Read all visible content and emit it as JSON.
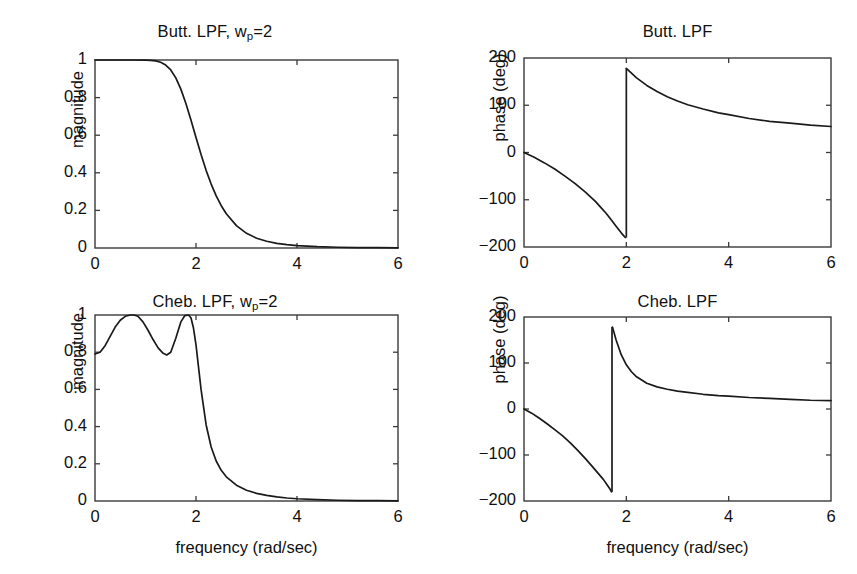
{
  "figure": {
    "background": "#ffffff",
    "line_color": "#1a1a1a",
    "axis_color": "#3a3a3a"
  },
  "panels": {
    "top_left": {
      "title_main": "Butt. LPF, w",
      "title_sub": "p",
      "title_tail": "=2"
    },
    "top_right": {
      "title_main": "Butt. LPF",
      "title_sub": "",
      "title_tail": ""
    },
    "bottom_left": {
      "title_main": "Cheb. LPF, w",
      "title_sub": "p",
      "title_tail": "=2"
    },
    "bottom_right": {
      "title_main": "Cheb. LPF",
      "title_sub": "",
      "title_tail": ""
    }
  },
  "chart_data": [
    {
      "id": "butterworth-magnitude",
      "type": "line",
      "title": "Butt. LPF, w_p=2",
      "xlabel": "",
      "ylabel": "magnitude",
      "xlim": [
        0,
        6
      ],
      "ylim": [
        0,
        1
      ],
      "xticks": [
        0,
        2,
        4,
        6
      ],
      "xticklabels": [
        "0",
        "2",
        "4",
        "6"
      ],
      "yticks": [
        0,
        0.2,
        0.4,
        0.6,
        0.8,
        1
      ],
      "yticklabels": [
        "0",
        "0.2",
        "0.4",
        "0.6",
        "0.8",
        "1"
      ],
      "grid": false,
      "legend": null,
      "x": [
        0,
        0.2,
        0.4,
        0.6,
        0.8,
        1.0,
        1.1,
        1.2,
        1.3,
        1.4,
        1.5,
        1.6,
        1.7,
        1.8,
        1.9,
        2.0,
        2.1,
        2.2,
        2.3,
        2.4,
        2.5,
        2.6,
        2.8,
        3.0,
        3.2,
        3.4,
        3.6,
        3.8,
        4.0,
        4.4,
        4.8,
        5.2,
        5.6,
        6.0
      ],
      "y": [
        1.0,
        1.0,
        1.0,
        1.0,
        1.0,
        0.999,
        0.998,
        0.995,
        0.988,
        0.973,
        0.947,
        0.905,
        0.845,
        0.769,
        0.681,
        0.588,
        0.497,
        0.413,
        0.34,
        0.277,
        0.225,
        0.182,
        0.119,
        0.078,
        0.052,
        0.036,
        0.025,
        0.018,
        0.013,
        0.007,
        0.004,
        0.0025,
        0.0015,
        0.001
      ]
    },
    {
      "id": "butterworth-phase",
      "type": "line",
      "title": "Butt. LPF",
      "xlabel": "",
      "ylabel": "phase (deg)",
      "xlim": [
        0,
        6
      ],
      "ylim": [
        -200,
        200
      ],
      "xticks": [
        0,
        2,
        4,
        6
      ],
      "xticklabels": [
        "0",
        "2",
        "4",
        "6"
      ],
      "yticks": [
        -200,
        -100,
        0,
        100,
        200
      ],
      "yticklabels": [
        "-200",
        "-100",
        "0",
        "100",
        "200"
      ],
      "grid": false,
      "legend": null,
      "discontinuity_x": 2.0,
      "segments": [
        {
          "x": [
            0,
            0.2,
            0.4,
            0.6,
            0.8,
            1.0,
            1.2,
            1.4,
            1.5,
            1.6,
            1.7,
            1.8,
            1.9,
            1.98
          ],
          "y": [
            0,
            -10,
            -22,
            -35,
            -50,
            -66,
            -84,
            -104,
            -116,
            -128,
            -142,
            -156,
            -170,
            -180
          ]
        },
        {
          "x": [
            2.0,
            2.1,
            2.2,
            2.4,
            2.6,
            2.8,
            3.0,
            3.2,
            3.5,
            3.8,
            4.0,
            4.4,
            4.8,
            5.2,
            5.6,
            6.0
          ],
          "y": [
            178,
            168,
            158,
            142,
            129,
            118,
            109,
            101,
            92,
            84,
            80,
            72,
            66,
            62,
            58,
            55
          ]
        }
      ]
    },
    {
      "id": "chebyshev-magnitude",
      "type": "line",
      "title": "Cheb. LPF, w_p=2",
      "xlabel": "frequency (rad/sec)",
      "ylabel": "magnitude",
      "xlim": [
        0,
        6
      ],
      "ylim": [
        0,
        1
      ],
      "xticks": [
        0,
        2,
        4,
        6
      ],
      "xticklabels": [
        "0",
        "2",
        "4",
        "6"
      ],
      "yticks": [
        0,
        0.2,
        0.4,
        0.6,
        0.8,
        1
      ],
      "yticklabels": [
        "0",
        "0.2",
        "0.4",
        "0.6",
        "0.8",
        "1"
      ],
      "grid": false,
      "legend": null,
      "ripple_min": 0.785,
      "ripple_max": 1.0,
      "x": [
        0,
        0.1,
        0.2,
        0.3,
        0.4,
        0.5,
        0.6,
        0.7,
        0.77,
        0.85,
        0.95,
        1.05,
        1.15,
        1.25,
        1.35,
        1.42,
        1.5,
        1.6,
        1.7,
        1.78,
        1.85,
        1.9,
        1.95,
        2.0,
        2.05,
        2.1,
        2.2,
        2.3,
        2.4,
        2.5,
        2.6,
        2.8,
        3.0,
        3.2,
        3.4,
        3.6,
        3.8,
        4.0,
        4.4,
        4.8,
        5.2,
        5.6,
        6.0
      ],
      "y": [
        0.79,
        0.8,
        0.835,
        0.885,
        0.935,
        0.972,
        0.993,
        1.0,
        1.0,
        0.993,
        0.963,
        0.918,
        0.868,
        0.823,
        0.794,
        0.785,
        0.8,
        0.875,
        0.963,
        0.997,
        1.0,
        0.985,
        0.93,
        0.84,
        0.72,
        0.6,
        0.41,
        0.29,
        0.215,
        0.165,
        0.13,
        0.085,
        0.058,
        0.041,
        0.03,
        0.022,
        0.016,
        0.012,
        0.007,
        0.004,
        0.0025,
        0.0015,
        0.001
      ]
    },
    {
      "id": "chebyshev-phase",
      "type": "line",
      "title": "Cheb. LPF",
      "xlabel": "frequency (rad/sec)",
      "ylabel": "phase (deg)",
      "xlim": [
        0,
        6
      ],
      "ylim": [
        -200,
        200
      ],
      "xticks": [
        0,
        2,
        4,
        6
      ],
      "xticklabels": [
        "0",
        "2",
        "4",
        "6"
      ],
      "yticks": [
        -200,
        -100,
        0,
        100,
        200
      ],
      "yticklabels": [
        "-200",
        "-100",
        "0",
        "100",
        "200"
      ],
      "grid": false,
      "legend": null,
      "discontinuity_x": 1.72,
      "segments": [
        {
          "x": [
            0,
            0.15,
            0.3,
            0.45,
            0.6,
            0.75,
            0.9,
            1.05,
            1.2,
            1.35,
            1.45,
            1.55,
            1.62,
            1.68,
            1.71
          ],
          "y": [
            0,
            -9,
            -20,
            -32,
            -45,
            -58,
            -73,
            -90,
            -108,
            -127,
            -140,
            -153,
            -164,
            -174,
            -180
          ]
        },
        {
          "x": [
            1.73,
            1.8,
            1.9,
            2.0,
            2.1,
            2.2,
            2.4,
            2.6,
            2.8,
            3.0,
            3.2,
            3.5,
            3.8,
            4.0,
            4.4,
            4.8,
            5.2,
            5.6,
            6.0
          ],
          "y": [
            178,
            150,
            118,
            96,
            81,
            70,
            56,
            48,
            43,
            39,
            36,
            32,
            29,
            28,
            25,
            23,
            21,
            19,
            18
          ]
        }
      ]
    }
  ],
  "axis_labels": {
    "magnitude": "magnitude",
    "phase": "phase (deg)",
    "frequency": "frequency (rad/sec)"
  }
}
